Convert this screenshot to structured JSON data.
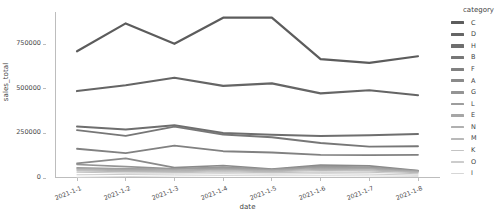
{
  "chart": {
    "type": "line",
    "xlabel": "date",
    "ylabel": "sales_total",
    "legend_title": "category"
  },
  "chart_data": {
    "type": "line",
    "title": "",
    "xlabel": "date",
    "ylabel": "sales_total",
    "legend_position": "right",
    "legend_title": "category",
    "grid": false,
    "x": [
      "2021-1-1",
      "2021-1-2",
      "2021-1-3",
      "2021-1-4",
      "2021-1-5",
      "2021-1-6",
      "2021-1-7",
      "2021-1-8"
    ],
    "xtick_labels": [
      "2021-1-1",
      "2021-1-2",
      "2021-1-3",
      "2021-1-4",
      "2021-1-5",
      "2021-1-6",
      "2021-1-7",
      "2021-1-8"
    ],
    "ytick_labels": [
      "0",
      "250000",
      "500000",
      "750000"
    ],
    "ytick_values": [
      0,
      250000,
      500000,
      750000
    ],
    "ylim": [
      0,
      930000
    ],
    "series": [
      {
        "name": "C",
        "color": "#5c5c5c",
        "values": [
          710000,
          866000,
          752000,
          898000,
          898000,
          666000,
          645000,
          682000
        ]
      },
      {
        "name": "D",
        "color": "#656565",
        "values": [
          487000,
          520000,
          562000,
          516000,
          530000,
          474000,
          492000,
          464000
        ]
      },
      {
        "name": "H",
        "color": "#6e6e6e",
        "values": [
          288000,
          272000,
          296000,
          252000,
          243000,
          236000,
          240000,
          247000
        ]
      },
      {
        "name": "B",
        "color": "#777777",
        "values": [
          268000,
          236000,
          288000,
          244000,
          228000,
          196000,
          176000,
          178000
        ]
      },
      {
        "name": "F",
        "color": "#818181",
        "values": [
          164000,
          139000,
          181000,
          150000,
          143000,
          129000,
          128000,
          130000
        ]
      },
      {
        "name": "A",
        "color": "#8a8a8a",
        "values": [
          82000,
          110000,
          58000,
          70000,
          50000,
          72000,
          68000,
          42000
        ]
      },
      {
        "name": "G",
        "color": "#949494",
        "values": [
          76000,
          64000,
          52000,
          62000,
          48000,
          66000,
          60000,
          40000
        ]
      },
      {
        "name": "L",
        "color": "#9d9d9d",
        "values": [
          58000,
          52000,
          50000,
          56000,
          46000,
          60000,
          58000,
          38000
        ]
      },
      {
        "name": "E",
        "color": "#a6a6a6",
        "values": [
          52000,
          48000,
          44000,
          50000,
          44000,
          54000,
          52000,
          36000
        ]
      },
      {
        "name": "N",
        "color": "#b0b0b0",
        "values": [
          46000,
          42000,
          40000,
          46000,
          40000,
          48000,
          46000,
          34000
        ]
      },
      {
        "name": "M",
        "color": "#b9b9b9",
        "values": [
          40000,
          36000,
          36000,
          40000,
          36000,
          42000,
          40000,
          30000
        ]
      },
      {
        "name": "K",
        "color": "#c3c3c3",
        "values": [
          32000,
          28000,
          30000,
          34000,
          30000,
          34000,
          32000,
          24000
        ]
      },
      {
        "name": "O",
        "color": "#cccccc",
        "values": [
          18000,
          20000,
          22000,
          24000,
          22000,
          24000,
          22000,
          16000
        ]
      },
      {
        "name": "I",
        "color": "#d6d6d6",
        "values": [
          4000,
          8000,
          12000,
          14000,
          13000,
          13000,
          12000,
          9000
        ]
      }
    ]
  }
}
